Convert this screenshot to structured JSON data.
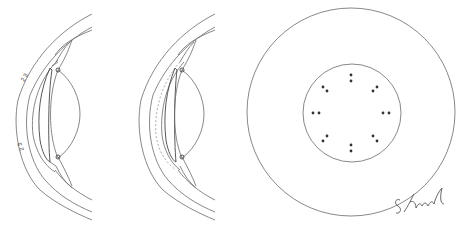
{
  "figure": {
    "panels": [
      {
        "id": "eye-cross-section-1",
        "description": "Anterior eye cross-section with cornea, iris, lens",
        "labels": [
          "2 3",
          "2 3"
        ]
      },
      {
        "id": "eye-cross-section-2",
        "description": "Anterior eye cross-section with dashed inner corneal layer"
      },
      {
        "id": "front-view",
        "description": "Front view: outer circle with inner circle containing 8 pairs of dots"
      }
    ],
    "signature": "S. Lund",
    "colors": {
      "line": "#6a6a6a",
      "dot": "#333333",
      "background": "#ffffff"
    },
    "dot_pairs": 8
  }
}
